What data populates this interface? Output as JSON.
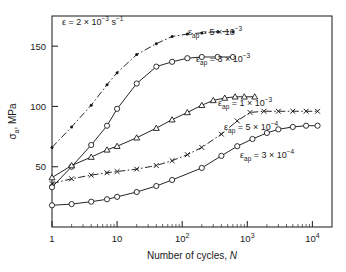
{
  "chart_data": {
    "type": "line",
    "title": "",
    "xlabel": "Number of cycles, N",
    "ylabel": "σa, MPa",
    "xscale": "log",
    "yscale": "linear",
    "xlim": [
      1,
      20000
    ],
    "ylim": [
      0,
      175
    ],
    "grid": false,
    "legend_position": "inline-right-of-curve",
    "xticks": [
      1,
      10,
      100,
      1000,
      10000
    ],
    "xtick_labels": [
      "1",
      "10",
      "10²",
      "10³",
      "10⁴"
    ],
    "yticks": [
      50,
      100,
      150
    ],
    "ytick_labels": [
      "50",
      "100",
      "150"
    ],
    "annotations": [
      {
        "id": "strain-rate",
        "text": "ε = 2 × 10⁻³ s⁻¹",
        "x_px": 62,
        "y_px": 25
      }
    ],
    "series": [
      {
        "name": "εap = 5 × 10⁻³",
        "label": "εap = 5 × 10⁻³",
        "marker": "filled-circle",
        "label_x_px": 188,
        "label_y_px": 35,
        "points": [
          [
            1,
            66
          ],
          [
            2,
            83
          ],
          [
            4,
            101
          ],
          [
            7,
            118
          ],
          [
            10,
            128
          ],
          [
            20,
            143
          ],
          [
            40,
            152
          ],
          [
            70,
            158
          ],
          [
            120,
            160
          ],
          [
            200,
            161
          ],
          [
            350,
            162
          ],
          [
            600,
            162
          ]
        ]
      },
      {
        "name": "εap = 3 × 10⁻³",
        "label": "εap = 3 × 10⁻³",
        "marker": "open-circle",
        "label_x_px": 196,
        "label_y_px": 62,
        "points": [
          [
            1,
            33
          ],
          [
            2,
            50
          ],
          [
            4,
            68
          ],
          [
            7,
            84
          ],
          [
            10,
            98
          ],
          [
            20,
            119
          ],
          [
            40,
            133
          ],
          [
            70,
            137
          ],
          [
            120,
            140
          ],
          [
            200,
            141
          ],
          [
            350,
            141
          ],
          [
            600,
            141
          ]
        ]
      },
      {
        "name": "εap = 1 × 10⁻³",
        "label": "εap = 1 × 10⁻³",
        "marker": "triangle",
        "label_x_px": 218,
        "label_y_px": 106,
        "points": [
          [
            1,
            41
          ],
          [
            2,
            51
          ],
          [
            4,
            58
          ],
          [
            7,
            64
          ],
          [
            10,
            67
          ],
          [
            20,
            74
          ],
          [
            40,
            82
          ],
          [
            70,
            89
          ],
          [
            120,
            95
          ],
          [
            200,
            101
          ],
          [
            300,
            105
          ],
          [
            450,
            107
          ],
          [
            650,
            108
          ],
          [
            900,
            108
          ],
          [
            1300,
            108
          ]
        ]
      },
      {
        "name": "εap = 5 × 10⁻⁴",
        "label": "εap = 5 × 10⁻⁴",
        "marker": "x",
        "label_x_px": 224,
        "label_y_px": 130,
        "points": [
          [
            1,
            36
          ],
          [
            2,
            40
          ],
          [
            4,
            43
          ],
          [
            7,
            45
          ],
          [
            10,
            46
          ],
          [
            20,
            48
          ],
          [
            40,
            51
          ],
          [
            70,
            55
          ],
          [
            120,
            60
          ],
          [
            200,
            66
          ],
          [
            400,
            77
          ],
          [
            700,
            88
          ],
          [
            1100,
            95
          ],
          [
            1800,
            96
          ],
          [
            3000,
            96
          ],
          [
            5000,
            96
          ],
          [
            8000,
            96
          ],
          [
            12000,
            96
          ]
        ]
      },
      {
        "name": "εap = 3 × 10⁻⁴",
        "label": "εap = 3 × 10⁻⁴",
        "marker": "open-circle",
        "label_x_px": 240,
        "label_y_px": 158,
        "points": [
          [
            1,
            18
          ],
          [
            2,
            19
          ],
          [
            4,
            21
          ],
          [
            7,
            23
          ],
          [
            10,
            25
          ],
          [
            20,
            29
          ],
          [
            40,
            34
          ],
          [
            70,
            39
          ],
          [
            200,
            49
          ],
          [
            400,
            59
          ],
          [
            700,
            67
          ],
          [
            1200,
            73
          ],
          [
            2000,
            78
          ],
          [
            3000,
            81
          ],
          [
            5000,
            83
          ],
          [
            8000,
            84
          ],
          [
            12000,
            84
          ]
        ]
      }
    ]
  }
}
